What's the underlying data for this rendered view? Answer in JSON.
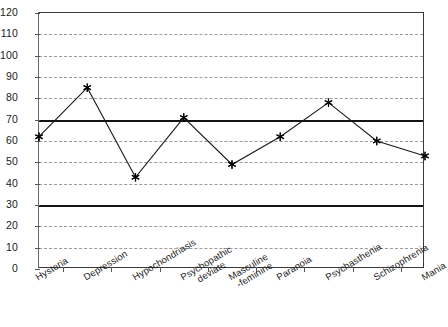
{
  "chart_data": {
    "type": "line",
    "title": "",
    "xlabel": "",
    "ylabel": "",
    "ylim": [
      0,
      120
    ],
    "ytick_step": 10,
    "grid": true,
    "legend": "none",
    "categories": [
      "Hysteria",
      "Depression",
      "Hypochondriasis",
      "Psychopathic\ndeviate",
      "Masculine\n -feminine",
      "Paranoia",
      "Psychasthenia",
      "Schizophrenia",
      "Mania"
    ],
    "values": [
      62,
      85,
      43,
      71,
      49,
      62,
      78,
      60,
      53
    ],
    "ytick_labels": [
      "0",
      "10",
      "20",
      "30",
      "40",
      "50",
      "60",
      "70",
      "80",
      "90",
      "100",
      "110",
      "120"
    ],
    "reference_lines": [
      {
        "value": 70,
        "style": "solid-thick",
        "color": "#141414"
      },
      {
        "value": 30,
        "style": "solid-thick",
        "color": "#141414"
      }
    ],
    "marker": "asterisk",
    "series_color": "#1a1a1a",
    "gridline_color": "#9b9b9b",
    "axis_color": "#3a3a3a"
  }
}
